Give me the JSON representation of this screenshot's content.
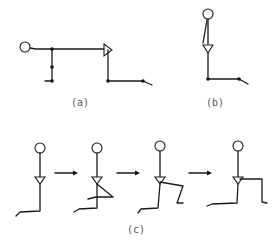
{
  "diagram": {
    "type": "stick-figure pose sequence",
    "panels": [
      {
        "id": "a",
        "label": "(a)",
        "description": "figure lying horizontal with bent legs"
      },
      {
        "id": "b",
        "label": "(b)",
        "description": "figure standing upright with foot forward"
      },
      {
        "id": "c",
        "label": "(c)",
        "description": "four-step sequence from standing to lunge",
        "steps": 4,
        "arrows": 3
      }
    ],
    "colors": {
      "line": "#1a1a1a",
      "label": "#555555",
      "background": "#ffffff"
    }
  }
}
